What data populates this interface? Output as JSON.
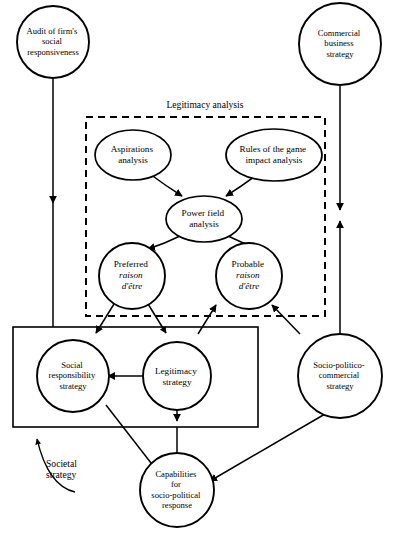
{
  "figure": {
    "type": "flow-diagram",
    "title_visible": false,
    "background_color": "#ffffff",
    "ink_color": "#000000"
  },
  "nodes": [
    {
      "id": "audit",
      "shape": "circle",
      "lines": [
        "Audit of firm's",
        "social",
        "responsiveness"
      ]
    },
    {
      "id": "commercial",
      "shape": "circle",
      "lines": [
        "Commercial",
        "business",
        "strategy"
      ]
    },
    {
      "id": "aspirations",
      "shape": "ellipse",
      "lines": [
        "Aspirations",
        "analysis"
      ]
    },
    {
      "id": "rules",
      "shape": "ellipse",
      "lines": [
        "Rules of the game",
        "impact analysis"
      ]
    },
    {
      "id": "powerfield",
      "shape": "ellipse",
      "lines": [
        "Power field",
        "analysis"
      ]
    },
    {
      "id": "preferred",
      "shape": "circle",
      "lines": [
        "Preferred",
        "raison",
        "d'être"
      ],
      "italic_lines": [
        1,
        2
      ]
    },
    {
      "id": "probable",
      "shape": "circle",
      "lines": [
        "Probable",
        "raison",
        "d'être"
      ],
      "italic_lines": [
        1,
        2
      ]
    },
    {
      "id": "social_responsibility",
      "shape": "circle",
      "lines": [
        "Social",
        "responsibility",
        "strategy"
      ]
    },
    {
      "id": "legitimacy_strategy",
      "shape": "circle",
      "lines": [
        "Legitimacy",
        "strategy"
      ]
    },
    {
      "id": "socio_politico",
      "shape": "circle",
      "lines": [
        "Socio-politico-",
        "commercial",
        "strategy"
      ]
    },
    {
      "id": "capabilities",
      "shape": "circle",
      "lines": [
        "Capabilities",
        "for",
        "socio-political",
        "response"
      ]
    }
  ],
  "groups": [
    {
      "id": "legitimacy_analysis",
      "label": "Legitimacy analysis",
      "border": "dashed"
    },
    {
      "id": "societal_strategy",
      "label_lines": [
        "Societal",
        "strategy"
      ],
      "border": "solid"
    }
  ],
  "edges": [
    {
      "from": "audit",
      "to": "powerfield-row"
    },
    {
      "from": "audit",
      "to": "societal-strategy-box"
    },
    {
      "from": "commercial",
      "to": "legitimacy-analysis-box"
    },
    {
      "from": "socio-politico-region",
      "to": "commercial"
    },
    {
      "from": "aspirations",
      "to": "powerfield"
    },
    {
      "from": "rules",
      "to": "powerfield"
    },
    {
      "from": "powerfield",
      "to": "preferred"
    },
    {
      "from": "powerfield",
      "to": "probable"
    },
    {
      "from": "preferred",
      "to": "social_responsibility"
    },
    {
      "from": "preferred",
      "to": "legitimacy_strategy"
    },
    {
      "from": "legitimacy_strategy",
      "to": "probable"
    },
    {
      "from": "socio_politico",
      "to": "probable"
    },
    {
      "from": "legitimacy_strategy",
      "to": "social_responsibility"
    },
    {
      "from": "legitimacy_strategy",
      "to": "capabilities"
    },
    {
      "from": "social_responsibility",
      "to": "capabilities"
    },
    {
      "from": "socio_politico",
      "to": "capabilities"
    },
    {
      "from": "capabilities",
      "to": "societal-strategy-box"
    }
  ]
}
